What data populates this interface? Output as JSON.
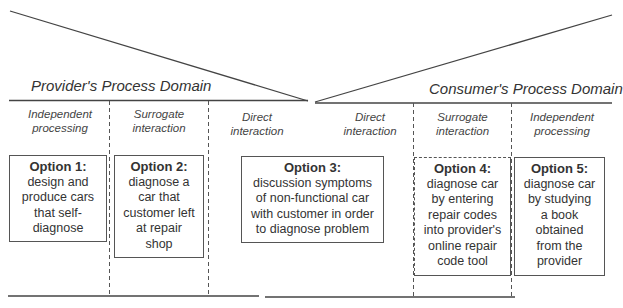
{
  "diagram": {
    "provider_domain": {
      "title": "Provider's Process Domain",
      "columns": [
        {
          "label_line1": "Independent",
          "label_line2": "processing"
        },
        {
          "label_line1": "Surrogate",
          "label_line2": "interaction"
        },
        {
          "label_line1": "Direct",
          "label_line2": "interaction"
        }
      ]
    },
    "consumer_domain": {
      "title": "Consumer's Process Domain",
      "columns": [
        {
          "label_line1": "Direct",
          "label_line2": "interaction"
        },
        {
          "label_line1": "Surrogate",
          "label_line2": "interaction"
        },
        {
          "label_line1": "Independent",
          "label_line2": "processing"
        }
      ]
    },
    "options": [
      {
        "title": "Option 1:",
        "lines": [
          "design and",
          "produce cars",
          "that self-",
          "diagnose"
        ]
      },
      {
        "title": "Option 2:",
        "lines": [
          "diagnose a",
          "car that",
          "customer left",
          "at repair",
          "shop"
        ]
      },
      {
        "title": "Option 3:",
        "lines": [
          "discussion symptoms",
          "of non-functional car",
          "with customer in order",
          "to diagnose problem"
        ]
      },
      {
        "title": "Option 4:",
        "lines": [
          "diagnose car",
          "by entering",
          "repair codes",
          "into provider's",
          "online repair",
          "code tool"
        ]
      },
      {
        "title": "Option 5:",
        "lines": [
          "diagnose car",
          "by studying",
          "a book",
          "obtained",
          "from the",
          "provider"
        ]
      }
    ],
    "colors": {
      "line": "#444444",
      "text": "#333333",
      "background": "#ffffff"
    }
  }
}
